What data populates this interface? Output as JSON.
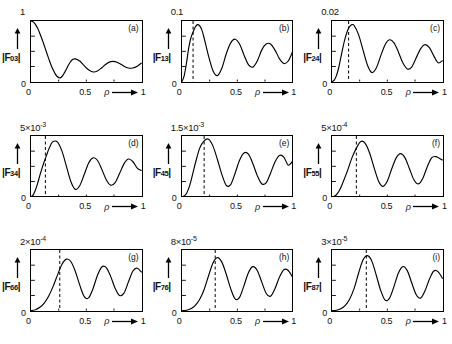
{
  "figure": {
    "kind": "multi-panel-line-plot",
    "rows": 3,
    "cols": 3,
    "axis": {
      "x_name": "ρ",
      "x_arrow": "⟶",
      "x_ticks": [
        "0",
        "0.5",
        "1"
      ],
      "origin_label": "0",
      "y_arrow": "↑"
    }
  },
  "chart_data": [
    {
      "type": "line",
      "panel": "(a)",
      "title": "",
      "ylabel": "|F03|",
      "ylabel_base": "|F",
      "ylabel_sub": "03",
      "ylabel_tail": "|",
      "xlabel": "ρ",
      "ymax_label": "1",
      "ymax_mantissa": "1",
      "ymax_exponent": "",
      "ylim": [
        0,
        1
      ],
      "xlim": [
        0,
        1
      ],
      "grid": false,
      "dashed_line_x": null,
      "x": [
        0.0,
        0.02,
        0.04,
        0.06,
        0.08,
        0.1,
        0.12,
        0.14,
        0.16,
        0.18,
        0.2,
        0.22,
        0.24,
        0.26,
        0.28,
        0.3,
        0.32,
        0.34,
        0.36,
        0.38,
        0.4,
        0.44,
        0.48,
        0.52,
        0.56,
        0.6,
        0.64,
        0.68,
        0.72,
        0.76,
        0.8,
        0.84,
        0.88,
        0.92,
        0.96,
        1.0
      ],
      "y": [
        1.0,
        0.985,
        0.945,
        0.88,
        0.795,
        0.7,
        0.595,
        0.485,
        0.38,
        0.28,
        0.195,
        0.125,
        0.08,
        0.062,
        0.085,
        0.14,
        0.21,
        0.28,
        0.335,
        0.368,
        0.375,
        0.34,
        0.265,
        0.195,
        0.16,
        0.175,
        0.23,
        0.292,
        0.33,
        0.33,
        0.3,
        0.255,
        0.225,
        0.225,
        0.255,
        0.31
      ]
    },
    {
      "type": "line",
      "panel": "(b)",
      "title": "",
      "ylabel": "|F13|",
      "ylabel_base": "|F",
      "ylabel_sub": "13",
      "ylabel_tail": "|",
      "xlabel": "ρ",
      "ymax_label": "0.1",
      "ymax_mantissa": "0.1",
      "ymax_exponent": "",
      "ylim": [
        0,
        0.1
      ],
      "xlim": [
        0,
        1
      ],
      "grid": false,
      "dashed_line_x": 0.1,
      "x": [
        0.0,
        0.02,
        0.04,
        0.06,
        0.08,
        0.1,
        0.12,
        0.14,
        0.16,
        0.18,
        0.2,
        0.24,
        0.28,
        0.32,
        0.36,
        0.4,
        0.44,
        0.48,
        0.52,
        0.56,
        0.6,
        0.64,
        0.68,
        0.72,
        0.76,
        0.8,
        0.84,
        0.88,
        0.92,
        0.96,
        1.0
      ],
      "y": [
        0.0,
        0.01,
        0.03,
        0.055,
        0.072,
        0.082,
        0.09,
        0.094,
        0.092,
        0.085,
        0.072,
        0.042,
        0.018,
        0.01,
        0.022,
        0.046,
        0.064,
        0.07,
        0.062,
        0.044,
        0.028,
        0.024,
        0.034,
        0.052,
        0.062,
        0.062,
        0.052,
        0.038,
        0.03,
        0.034,
        0.05
      ]
    },
    {
      "type": "line",
      "panel": "(c)",
      "title": "",
      "ylabel": "|F24|",
      "ylabel_base": "|F",
      "ylabel_sub": "24",
      "ylabel_tail": "|",
      "xlabel": "ρ",
      "ymax_label": "0.02",
      "ymax_mantissa": "0.02",
      "ymax_exponent": "",
      "ylim": [
        0,
        0.02
      ],
      "xlim": [
        0,
        1
      ],
      "grid": false,
      "dashed_line_x": 0.15,
      "x": [
        0.0,
        0.02,
        0.04,
        0.06,
        0.08,
        0.1,
        0.12,
        0.14,
        0.16,
        0.18,
        0.2,
        0.24,
        0.28,
        0.32,
        0.36,
        0.4,
        0.44,
        0.48,
        0.52,
        0.56,
        0.6,
        0.64,
        0.68,
        0.72,
        0.76,
        0.8,
        0.84,
        0.88,
        0.92,
        0.96,
        1.0
      ],
      "y": [
        0.0,
        0.0005,
        0.002,
        0.0045,
        0.008,
        0.0115,
        0.0145,
        0.0168,
        0.0182,
        0.0188,
        0.0185,
        0.0155,
        0.0105,
        0.0055,
        0.003,
        0.0045,
        0.0085,
        0.0122,
        0.0138,
        0.0128,
        0.0098,
        0.0062,
        0.0042,
        0.0048,
        0.0078,
        0.0108,
        0.0122,
        0.0112,
        0.0085,
        0.0062,
        0.007
      ]
    },
    {
      "type": "line",
      "panel": "(d)",
      "title": "",
      "ylabel": "|F34|",
      "ylabel_base": "|F",
      "ylabel_sub": "34",
      "ylabel_tail": "|",
      "xlabel": "ρ",
      "ymax_label": "5x10^-3",
      "ymax_mantissa": "5×10",
      "ymax_exponent": "-3",
      "ylim": [
        0,
        0.005
      ],
      "xlim": [
        0,
        1
      ],
      "grid": false,
      "dashed_line_x": 0.13,
      "x": [
        0.0,
        0.02,
        0.04,
        0.06,
        0.08,
        0.1,
        0.12,
        0.14,
        0.16,
        0.18,
        0.2,
        0.24,
        0.28,
        0.32,
        0.36,
        0.4,
        0.44,
        0.48,
        0.52,
        0.56,
        0.6,
        0.64,
        0.68,
        0.72,
        0.76,
        0.8,
        0.84,
        0.88,
        0.92,
        0.96,
        1.0
      ],
      "y": [
        0.0,
        0.00015,
        0.00055,
        0.0011,
        0.00175,
        0.00235,
        0.0029,
        0.0034,
        0.0039,
        0.0043,
        0.00455,
        0.0045,
        0.00375,
        0.0025,
        0.00125,
        0.0006,
        0.0009,
        0.0018,
        0.00275,
        0.0032,
        0.003,
        0.00225,
        0.0014,
        0.00095,
        0.00115,
        0.0019,
        0.0027,
        0.0031,
        0.0029,
        0.00235,
        0.00215
      ]
    },
    {
      "type": "line",
      "panel": "(e)",
      "title": "",
      "ylabel": "|F45|",
      "ylabel_base": "|F",
      "ylabel_sub": "45",
      "ylabel_tail": "|",
      "xlabel": "ρ",
      "ymax_label": "1.5x10^-3",
      "ymax_mantissa": "1.5×10",
      "ymax_exponent": "-3",
      "ylim": [
        0,
        0.0015
      ],
      "xlim": [
        0,
        1
      ],
      "grid": false,
      "dashed_line_x": 0.2,
      "x": [
        0.0,
        0.02,
        0.04,
        0.06,
        0.08,
        0.1,
        0.12,
        0.16,
        0.2,
        0.24,
        0.28,
        0.32,
        0.36,
        0.4,
        0.44,
        0.48,
        0.52,
        0.56,
        0.6,
        0.64,
        0.68,
        0.72,
        0.76,
        0.8,
        0.84,
        0.88,
        0.92,
        0.96,
        1.0
      ],
      "y": [
        0.0,
        2e-05,
        8e-05,
        0.0002,
        0.00038,
        0.0006,
        0.00082,
        0.0012,
        0.00138,
        0.00142,
        0.00125,
        0.00092,
        0.00055,
        0.00028,
        0.0003,
        0.00058,
        0.0009,
        0.00108,
        0.00105,
        0.00082,
        0.00052,
        0.00032,
        0.00034,
        0.00058,
        0.00086,
        0.00102,
        0.00098,
        0.00078,
        0.00088
      ]
    },
    {
      "type": "line",
      "panel": "(f)",
      "title": "",
      "ylabel": "|F55|",
      "ylabel_base": "|F",
      "ylabel_sub": "55",
      "ylabel_tail": "|",
      "xlabel": "ρ",
      "ymax_label": "5x10^-4",
      "ymax_mantissa": "5×10",
      "ymax_exponent": "-4",
      "ylim": [
        0,
        0.0005
      ],
      "xlim": [
        0,
        1
      ],
      "grid": false,
      "dashed_line_x": 0.22,
      "x": [
        0.0,
        0.02,
        0.04,
        0.06,
        0.08,
        0.1,
        0.14,
        0.18,
        0.22,
        0.26,
        0.3,
        0.34,
        0.38,
        0.42,
        0.46,
        0.5,
        0.54,
        0.58,
        0.62,
        0.66,
        0.7,
        0.74,
        0.78,
        0.82,
        0.86,
        0.9,
        0.94,
        1.0
      ],
      "y": [
        0.0,
        4e-06,
        1.6e-05,
        4e-05,
        7.5e-05,
        0.00012,
        0.000215,
        0.00032,
        0.0004,
        0.000455,
        0.00044,
        0.00036,
        0.00024,
        0.00013,
        8.5e-05,
        0.00013,
        0.00023,
        0.00032,
        0.000355,
        0.00032,
        0.00023,
        0.00014,
        0.000105,
        0.00015,
        0.000245,
        0.00032,
        0.00033,
        0.0003
      ]
    },
    {
      "type": "line",
      "panel": "(g)",
      "title": "",
      "ylabel": "|F66|",
      "ylabel_base": "|F",
      "ylabel_sub": "66",
      "ylabel_tail": "|",
      "xlabel": "ρ",
      "ymax_label": "2x10^-4",
      "ymax_mantissa": "2×10",
      "ymax_exponent": "-4",
      "ylim": [
        0,
        0.0002
      ],
      "xlim": [
        0,
        1
      ],
      "grid": false,
      "dashed_line_x": 0.26,
      "x": [
        0.0,
        0.04,
        0.08,
        0.12,
        0.16,
        0.2,
        0.24,
        0.28,
        0.32,
        0.36,
        0.4,
        0.44,
        0.48,
        0.52,
        0.56,
        0.6,
        0.64,
        0.68,
        0.72,
        0.76,
        0.8,
        0.84,
        0.88,
        0.92,
        0.96,
        1.0
      ],
      "y": [
        0.0,
        3e-06,
        1.1e-05,
        2.5e-05,
        4.8e-05,
        8e-05,
        0.000118,
        0.000153,
        0.00017,
        0.000162,
        0.00013,
        8.5e-05,
        4.7e-05,
        4.2e-05,
        7.2e-05,
        0.000116,
        0.000144,
        0.000142,
        0.000113,
        7.4e-05,
        5e-05,
        5.8e-05,
        9.4e-05,
        0.00013,
        0.00014,
        0.000126
      ]
    },
    {
      "type": "line",
      "panel": "(h)",
      "title": "",
      "ylabel": "|F76|",
      "ylabel_base": "|F",
      "ylabel_sub": "76",
      "ylabel_tail": "|",
      "xlabel": "ρ",
      "ymax_label": "8x10^-5",
      "ymax_mantissa": "8×10",
      "ymax_exponent": "-5",
      "ylim": [
        0,
        8e-05
      ],
      "xlim": [
        0,
        1
      ],
      "grid": false,
      "dashed_line_x": 0.3,
      "x": [
        0.0,
        0.04,
        0.08,
        0.12,
        0.16,
        0.2,
        0.24,
        0.28,
        0.32,
        0.36,
        0.4,
        0.44,
        0.48,
        0.52,
        0.56,
        0.6,
        0.64,
        0.68,
        0.72,
        0.76,
        0.8,
        0.84,
        0.88,
        0.92,
        0.96,
        1.0
      ],
      "y": [
        0.0,
        5e-07,
        2.5e-06,
        7e-06,
        1.5e-05,
        2.8e-05,
        4.6e-05,
        6.3e-05,
        7e-05,
        6.4e-05,
        4.8e-05,
        2.9e-05,
        1.55e-05,
        1.75e-05,
        3.3e-05,
        5e-05,
        5.8e-05,
        5.3e-05,
        3.8e-05,
        2.3e-05,
        1.9e-05,
        2.9e-05,
        4.4e-05,
        5.4e-05,
        5.3e-05,
        4.4e-05
      ]
    },
    {
      "type": "line",
      "panel": "(i)",
      "title": "",
      "ylabel": "|F87|",
      "ylabel_base": "|F",
      "ylabel_sub": "87",
      "ylabel_tail": "|",
      "xlabel": "ρ",
      "ymax_label": "3x10^-5",
      "ymax_mantissa": "3×10",
      "ymax_exponent": "-5",
      "ylim": [
        0,
        3e-05
      ],
      "xlim": [
        0,
        1
      ],
      "grid": false,
      "dashed_line_x": 0.31,
      "x": [
        0.0,
        0.04,
        0.08,
        0.12,
        0.16,
        0.2,
        0.24,
        0.28,
        0.32,
        0.36,
        0.4,
        0.44,
        0.48,
        0.52,
        0.56,
        0.6,
        0.64,
        0.68,
        0.72,
        0.76,
        0.8,
        0.84,
        0.88,
        0.92,
        0.96,
        1.0
      ],
      "y": [
        0.0,
        2e-07,
        9e-07,
        2.6e-06,
        5.8e-06,
        1.1e-05,
        1.85e-05,
        2.5e-05,
        2.72e-05,
        2.45e-05,
        1.75e-05,
        1e-05,
        5.2e-06,
        6.2e-06,
        1.2e-05,
        1.86e-05,
        2.18e-05,
        1.98e-05,
        1.38e-05,
        8e-06,
        6.2e-06,
        9.8e-06,
        1.55e-05,
        1.96e-05,
        1.92e-05,
        1.58e-05
      ]
    }
  ]
}
